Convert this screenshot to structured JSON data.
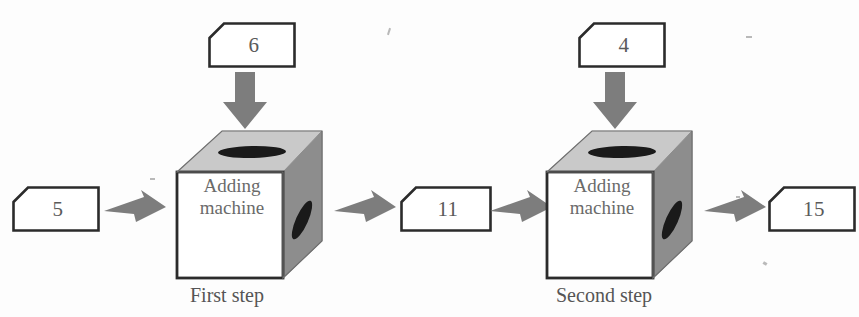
{
  "diagram": {
    "type": "flow",
    "machine_label_line1": "Adding",
    "machine_label_line2": "machine",
    "colors": {
      "outline": "#2b2b2b",
      "front_face": "#ffffff",
      "top_face": "#c9c9c9",
      "side_face": "#8d8d8d",
      "slot": "#1a1a1a",
      "arrow": "#7d7d7d",
      "text": "#5a5a5a"
    },
    "steps": [
      {
        "caption": "First step",
        "input_left": "5",
        "input_top": "6",
        "output": "11"
      },
      {
        "caption": "Second step",
        "input_left": "11",
        "input_top": "4",
        "output": "15"
      }
    ],
    "values": {
      "start": "5",
      "add_first": "6",
      "middle": "11",
      "add_second": "4",
      "result": "15"
    }
  }
}
